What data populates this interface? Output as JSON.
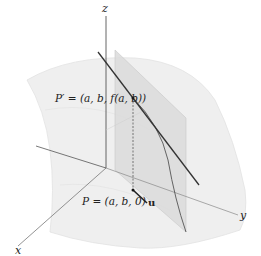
{
  "figure": {
    "axes": {
      "x_label": "x",
      "y_label": "y",
      "z_label": "z"
    },
    "points": {
      "p_prime_label": "P′ = (a, b, f(a, b))",
      "p_label": "P = (a, b, 0)",
      "u_label": "u"
    },
    "colors": {
      "surface_fill": "#efefef",
      "plane_fill": "#d9d9d9",
      "axis": "#555555",
      "tangent_line": "#333333",
      "curve": "#555555"
    }
  }
}
